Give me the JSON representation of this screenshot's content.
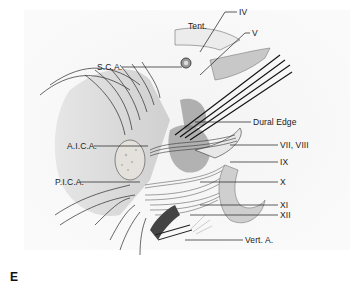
{
  "figure": {
    "panel_letter": "E",
    "labels": [
      {
        "id": "tent",
        "text": "Tent.",
        "x": 188,
        "y": 22
      },
      {
        "id": "iv",
        "text": "IV",
        "x": 239,
        "y": 8
      },
      {
        "id": "v",
        "text": "V",
        "x": 252,
        "y": 29
      },
      {
        "id": "sca",
        "text": "S.C.A.",
        "x": 97,
        "y": 63
      },
      {
        "id": "dural-edge",
        "text": "Dural Edge",
        "x": 253,
        "y": 119
      },
      {
        "id": "aica",
        "text": "A.I.C.A.",
        "x": 67,
        "y": 142
      },
      {
        "id": "vii-viii",
        "text": "VII, VIII",
        "x": 280,
        "y": 141
      },
      {
        "id": "ix",
        "text": "IX",
        "x": 280,
        "y": 158
      },
      {
        "id": "pica",
        "text": "P.I.C.A.",
        "x": 55,
        "y": 178
      },
      {
        "id": "x",
        "text": "X",
        "x": 280,
        "y": 178
      },
      {
        "id": "xi",
        "text": "XI",
        "x": 280,
        "y": 201
      },
      {
        "id": "xii",
        "text": "XII",
        "x": 280,
        "y": 211
      },
      {
        "id": "vert-a",
        "text": "Vert. A.",
        "x": 245,
        "y": 236
      }
    ],
    "colors": {
      "background": "#ffffff",
      "paper": "#f2f2f2",
      "ink": "#1a1a1a",
      "shade_light": "#dcdcdc",
      "shade_mid": "#b8b8b8",
      "shade_dark": "#5a5a5a"
    }
  }
}
